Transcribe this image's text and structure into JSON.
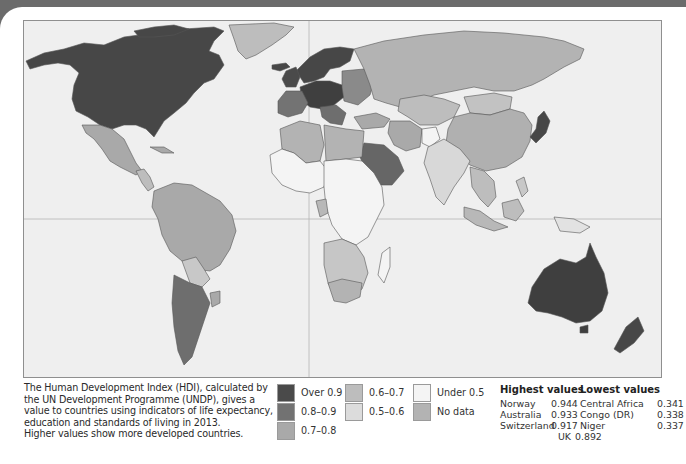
{
  "caption": {
    "lines": [
      "The Human Development Index (HDI), calculated by",
      "the UN Development Programme (UNDP), gives a",
      "value to countries using indicators of life expectancy,",
      "education and standards of living in 2013.",
      "Higher values show more developed countries."
    ]
  },
  "legend": {
    "items": [
      {
        "label": "Over 0.9",
        "color": "#4a4a4a"
      },
      {
        "label": "0.8–0.9",
        "color": "#727272"
      },
      {
        "label": "0.7–0.8",
        "color": "#a9a9a9"
      },
      {
        "label": "0.6–0.7",
        "color": "#bdbdbd"
      },
      {
        "label": "0.5–0.6",
        "color": "#dcdcdc"
      },
      {
        "label": "Under 0.5",
        "color": "#f4f4f4"
      },
      {
        "label": "No data",
        "color": "#b3b3b3"
      }
    ]
  },
  "highest": {
    "title": "Highest values",
    "rows": [
      {
        "country": "Norway",
        "value": "0.944"
      },
      {
        "country": "Australia",
        "value": "0.933"
      },
      {
        "country": "Switzerland",
        "value": "0.917"
      },
      {
        "country": "UK",
        "value": "0.892"
      }
    ]
  },
  "lowest": {
    "title": "Lowest values",
    "rows": [
      {
        "country": "Central Africa",
        "value": "0.341"
      },
      {
        "country": "Congo (DR)",
        "value": "0.338"
      },
      {
        "country": "Niger",
        "value": "0.337"
      }
    ]
  },
  "map": {
    "title": "World map of Human Development Index (HDI) 2013",
    "colors": {
      "ocean": "#efefef",
      "over_0_9": "#4a4a4a",
      "r0_8_0_9": "#727272",
      "r0_7_0_8": "#a9a9a9",
      "r0_6_0_7": "#bdbdbd",
      "r0_5_0_6": "#dcdcdc",
      "under_0_5": "#f7f7f7",
      "border": "#555555"
    }
  }
}
